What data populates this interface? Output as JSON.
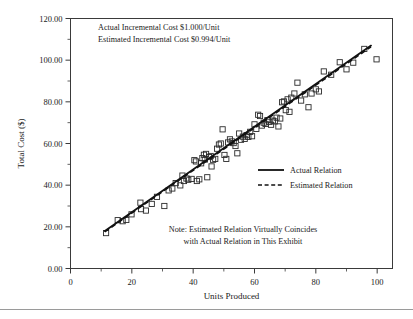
{
  "chart_data": {
    "type": "scatter",
    "title": "",
    "xlabel": "Units Produced",
    "ylabel": "Total Cost ($)",
    "xlim": [
      0,
      105
    ],
    "ylim": [
      0,
      120
    ],
    "xticks": [
      0,
      20,
      40,
      60,
      80,
      100
    ],
    "xtick_labels": [
      "0",
      "20",
      "40",
      "60",
      "80",
      "100"
    ],
    "x_minor_ticks": [
      10,
      30,
      50,
      70,
      90
    ],
    "yticks": [
      0,
      20,
      40,
      60,
      80,
      100,
      120
    ],
    "ytick_labels": [
      "0.00",
      "20.00",
      "40.00",
      "60.00",
      "80.00",
      "100.00",
      "120.00"
    ],
    "y_minor_ticks": [
      10,
      30,
      50,
      70,
      90,
      110
    ],
    "grid": false,
    "legend_position": "center-right",
    "legend": [
      {
        "label": "Actual Relation",
        "style": "solid"
      },
      {
        "label": "Estimated Relation",
        "style": "dashed"
      }
    ],
    "annotations": [
      "Actual Incremental Cost $1.000/Unit",
      "Estimated Incremental Cost $0.994/Unit"
    ],
    "note_lines": [
      "Note:  Estimated Relation Virtually Coincides",
      "with Actual Relation in This Exhibit"
    ],
    "series": [
      {
        "name": "Actual Relation",
        "style": "solid",
        "type": "line",
        "x": [
          11.2,
          98.0
        ],
        "y": [
          18.0,
          107.0
        ]
      },
      {
        "name": "Estimated Relation",
        "style": "dashed",
        "type": "line",
        "x": [
          11.2,
          98.0
        ],
        "y": [
          17.6,
          106.4
        ]
      },
      {
        "name": "Observations",
        "style": "open-square",
        "type": "scatter",
        "points": [
          [
            11.6,
            17.0
          ],
          [
            15.4,
            23.2
          ],
          [
            17.0,
            22.7
          ],
          [
            18.2,
            23.3
          ],
          [
            19.9,
            26.0
          ],
          [
            22.8,
            31.6
          ],
          [
            23.0,
            28.5
          ],
          [
            24.6,
            27.8
          ],
          [
            26.5,
            31.0
          ],
          [
            28.2,
            34.4
          ],
          [
            30.6,
            30.0
          ],
          [
            32.0,
            37.5
          ],
          [
            33.2,
            38.4
          ],
          [
            34.3,
            41.0
          ],
          [
            35.8,
            39.9
          ],
          [
            36.5,
            44.6
          ],
          [
            37.0,
            42.0
          ],
          [
            37.8,
            43.2
          ],
          [
            38.4,
            42.6
          ],
          [
            39.5,
            43.0
          ],
          [
            40.4,
            52.0
          ],
          [
            40.9,
            51.4
          ],
          [
            41.2,
            42.0
          ],
          [
            42.0,
            42.8
          ],
          [
            42.6,
            50.5
          ],
          [
            43.0,
            53.0
          ],
          [
            43.5,
            54.6
          ],
          [
            43.8,
            52.3
          ],
          [
            44.2,
            55.0
          ],
          [
            44.6,
            43.8
          ],
          [
            45.2,
            53.5
          ],
          [
            45.7,
            54.0
          ],
          [
            46.0,
            49.0
          ],
          [
            46.5,
            52.2
          ],
          [
            47.2,
            52.6
          ],
          [
            47.8,
            57.5
          ],
          [
            48.4,
            59.5
          ],
          [
            49.0,
            60.0
          ],
          [
            49.6,
            66.8
          ],
          [
            50.2,
            54.5
          ],
          [
            50.8,
            52.6
          ],
          [
            51.4,
            60.5
          ],
          [
            52.0,
            62.0
          ],
          [
            52.6,
            61.0
          ],
          [
            53.2,
            60.2
          ],
          [
            53.8,
            58.8
          ],
          [
            54.4,
            55.3
          ],
          [
            55.0,
            64.8
          ],
          [
            55.6,
            61.8
          ],
          [
            56.2,
            63.3
          ],
          [
            56.8,
            62.2
          ],
          [
            57.4,
            64.0
          ],
          [
            58.0,
            63.2
          ],
          [
            58.6,
            65.6
          ],
          [
            59.2,
            63.5
          ],
          [
            60.0,
            69.2
          ],
          [
            60.6,
            67.0
          ],
          [
            61.2,
            73.8
          ],
          [
            61.8,
            73.2
          ],
          [
            62.4,
            68.6
          ],
          [
            63.0,
            70.0
          ],
          [
            63.6,
            69.4
          ],
          [
            64.2,
            71.2
          ],
          [
            64.8,
            70.4
          ],
          [
            65.4,
            69.0
          ],
          [
            66.0,
            71.0
          ],
          [
            66.6,
            70.6
          ],
          [
            67.2,
            72.4
          ],
          [
            67.8,
            68.2
          ],
          [
            68.4,
            72.0
          ],
          [
            69.0,
            79.8
          ],
          [
            69.6,
            80.2
          ],
          [
            70.2,
            76.0
          ],
          [
            70.8,
            81.2
          ],
          [
            71.4,
            75.2
          ],
          [
            72.0,
            82.0
          ],
          [
            73.0,
            84.0
          ],
          [
            74.0,
            89.2
          ],
          [
            75.2,
            80.6
          ],
          [
            76.4,
            83.6
          ],
          [
            77.6,
            77.4
          ],
          [
            78.6,
            84.0
          ],
          [
            80.0,
            86.0
          ],
          [
            81.0,
            85.0
          ],
          [
            82.6,
            94.6
          ],
          [
            85.0,
            93.0
          ],
          [
            87.8,
            99.0
          ],
          [
            90.0,
            95.6
          ],
          [
            92.2,
            98.8
          ],
          [
            95.8,
            105.4
          ],
          [
            99.8,
            100.4
          ]
        ]
      }
    ]
  }
}
